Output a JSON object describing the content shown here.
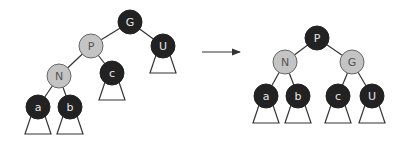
{
  "colors": {
    "black_node": "#222222",
    "red_node": "#c4c4c4",
    "edge": "#333333",
    "black_text": "#e6e6e6",
    "red_text": "#555555"
  },
  "node_radius": 12,
  "trees": [
    {
      "name": "before-rotation",
      "nodes": [
        {
          "id": "G",
          "label": "G",
          "color": "black",
          "x": 130,
          "y": 22
        },
        {
          "id": "P",
          "label": "P",
          "color": "red",
          "x": 91,
          "y": 46
        },
        {
          "id": "U",
          "label": "U",
          "color": "black",
          "x": 163,
          "y": 46
        },
        {
          "id": "N",
          "label": "N",
          "color": "red",
          "x": 59,
          "y": 76
        },
        {
          "id": "c",
          "label": "c",
          "color": "black",
          "x": 112,
          "y": 73
        },
        {
          "id": "a",
          "label": "a",
          "color": "black",
          "x": 38,
          "y": 107
        },
        {
          "id": "b",
          "label": "b",
          "color": "black",
          "x": 70,
          "y": 107
        }
      ],
      "edges": [
        [
          "G",
          "P"
        ],
        [
          "G",
          "U"
        ],
        [
          "P",
          "N"
        ],
        [
          "P",
          "c"
        ],
        [
          "N",
          "a"
        ],
        [
          "N",
          "b"
        ]
      ],
      "subtrees": [
        "U",
        "c",
        "a",
        "b"
      ]
    },
    {
      "name": "after-rotation",
      "nodes": [
        {
          "id": "P",
          "label": "P",
          "color": "black",
          "x": 317,
          "y": 38
        },
        {
          "id": "N",
          "label": "N",
          "color": "red",
          "x": 285,
          "y": 62
        },
        {
          "id": "G",
          "label": "G",
          "color": "red",
          "x": 352,
          "y": 62
        },
        {
          "id": "a",
          "label": "a",
          "color": "black",
          "x": 266,
          "y": 96
        },
        {
          "id": "b",
          "label": "b",
          "color": "black",
          "x": 298,
          "y": 96
        },
        {
          "id": "c",
          "label": "c",
          "color": "black",
          "x": 338,
          "y": 96
        },
        {
          "id": "U",
          "label": "U",
          "color": "black",
          "x": 372,
          "y": 96
        }
      ],
      "edges": [
        [
          "P",
          "N"
        ],
        [
          "P",
          "G"
        ],
        [
          "N",
          "a"
        ],
        [
          "N",
          "b"
        ],
        [
          "G",
          "c"
        ],
        [
          "G",
          "U"
        ]
      ],
      "subtrees": [
        "a",
        "b",
        "c",
        "U"
      ]
    }
  ],
  "arrow": {
    "x1": 202,
    "y1": 52,
    "x2": 240,
    "y2": 52
  }
}
